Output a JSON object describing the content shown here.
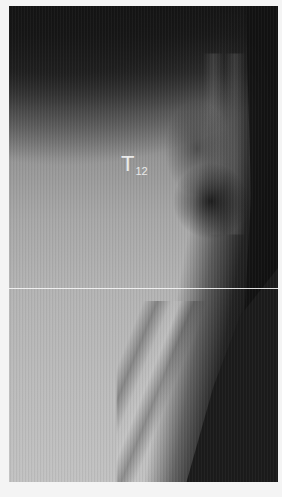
{
  "image": {
    "type": "radiograph",
    "background": "#f4f4f4",
    "annotation": {
      "main": "T",
      "subscript": "12",
      "color": "#eaeaea"
    }
  }
}
